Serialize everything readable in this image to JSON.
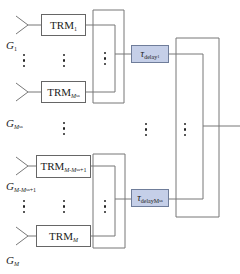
{
  "diagram": {
    "type": "phased-array subarray beamforming block diagram",
    "colors": {
      "line": "#666666",
      "delay_fill": "#c5cfe8",
      "delay_border": "#6f7d9a",
      "text": "#222222"
    },
    "antenna_labels": {
      "g1": {
        "main": "G",
        "sub": "1"
      },
      "gmsa": {
        "main": "G",
        "sub": "M",
        "subsub": "sa"
      },
      "gmmsa1": {
        "main": "G",
        "sub": "M-M",
        "subsub": "sa",
        "tail": "+1"
      },
      "gm": {
        "main": "G",
        "sub": "M"
      }
    },
    "trm_modules": [
      {
        "id": "trm-1",
        "main": "TRM",
        "sub": "1"
      },
      {
        "id": "trm-msa",
        "main": "TRM",
        "sub": "M",
        "subsub": "sa"
      },
      {
        "id": "trm-m-msa-1",
        "main": "TRM",
        "sub": "M-M",
        "subsub": "sa",
        "tail": "+1"
      },
      {
        "id": "trm-m",
        "main": "TRM",
        "sub": "M"
      }
    ],
    "delay_blocks": [
      {
        "id": "delay-1",
        "symbol": "τ",
        "sub": "delay",
        "subsub": "1"
      },
      {
        "id": "delay-msa",
        "symbol": "τ",
        "sub": "delayM",
        "subsub": "sa"
      }
    ],
    "ellipsis": "⋮"
  }
}
